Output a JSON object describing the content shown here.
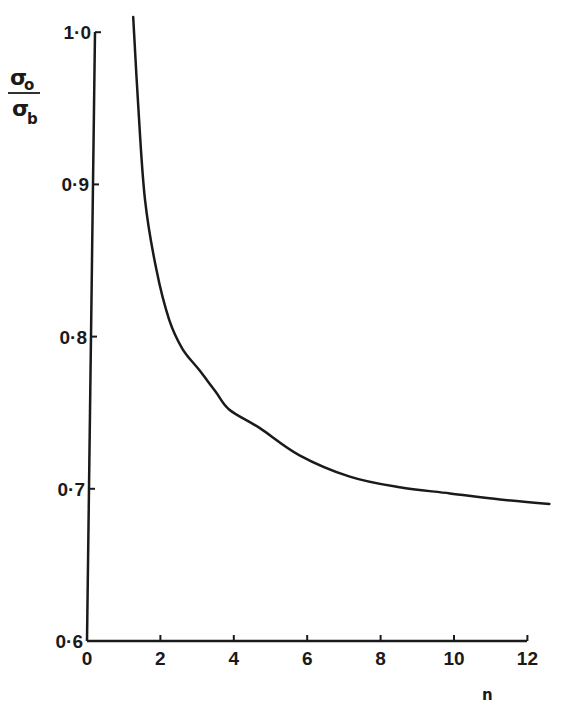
{
  "chart_data": {
    "type": "line",
    "title": "",
    "xlabel": "n",
    "ylabel": "σo/σb",
    "ylabel_parts": {
      "numerator": "σ",
      "numerator_sub": "o",
      "denominator": "σ",
      "denominator_sub": "b"
    },
    "xlim": [
      0,
      12.6
    ],
    "ylim": [
      0.6,
      1.0
    ],
    "x_ticks": [
      0,
      2,
      4,
      6,
      8,
      10,
      12
    ],
    "x_tick_labels": [
      "0",
      "2",
      "4",
      "6",
      "8",
      "10",
      "12"
    ],
    "y_ticks": [
      0.6,
      0.7,
      0.8,
      0.9,
      1.0
    ],
    "y_tick_labels": [
      "0·6",
      "0·7",
      "0·8",
      "0·9",
      "1·0"
    ],
    "grid": false,
    "legend": null,
    "series": [
      {
        "name": "σo/σb vs n",
        "x": [
          1.26,
          1.4,
          1.58,
          1.89,
          2.24,
          2.6,
          3.06,
          3.5,
          3.88,
          4.7,
          5.79,
          7.16,
          8.52,
          9.89,
          11.26,
          12.6
        ],
        "y": [
          1.01,
          0.95,
          0.89,
          0.844,
          0.811,
          0.792,
          0.778,
          0.764,
          0.752,
          0.74,
          0.722,
          0.708,
          0.701,
          0.697,
          0.693,
          0.69
        ]
      }
    ]
  }
}
